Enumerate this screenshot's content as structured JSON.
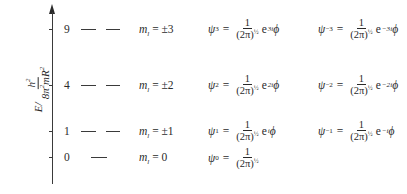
{
  "diagram": {
    "type": "energy-level-diagram",
    "y_axis": {
      "label_prefix": "E/",
      "label_numerator": "h",
      "label_numerator_sup": "2",
      "label_denominator": "8π",
      "label_denominator_sup1": "2",
      "label_denominator_mid": "mR",
      "label_denominator_sup2": "2"
    },
    "levels": [
      {
        "energy": "9",
        "degeneracy": 2,
        "ml_symbol": "m",
        "ml_sub": "l",
        "ml_value": "= ±3",
        "psi_pos": {
          "sym": "ψ",
          "sub": "3",
          "num": "1",
          "den": "(2π)",
          "den_sup": "½",
          "exp_base": "e",
          "exp_sup": "3i",
          "var": "ϕ"
        },
        "psi_neg": {
          "sym": "ψ",
          "sub": "−3",
          "num": "1",
          "den": "(2π)",
          "den_sup": "½",
          "exp_base": "e",
          "exp_sup": "−3i",
          "var": "ϕ"
        }
      },
      {
        "energy": "4",
        "degeneracy": 2,
        "ml_symbol": "m",
        "ml_sub": "l",
        "ml_value": "= ±2",
        "psi_pos": {
          "sym": "ψ",
          "sub": "2",
          "num": "1",
          "den": "(2π)",
          "den_sup": "½",
          "exp_base": "e",
          "exp_sup": "2i",
          "var": "ϕ"
        },
        "psi_neg": {
          "sym": "ψ",
          "sub": "−2",
          "num": "1",
          "den": "(2π)",
          "den_sup": "½",
          "exp_base": "e",
          "exp_sup": "−2i",
          "var": "ϕ"
        }
      },
      {
        "energy": "1",
        "degeneracy": 2,
        "ml_symbol": "m",
        "ml_sub": "l",
        "ml_value": "= ±1",
        "psi_pos": {
          "sym": "ψ",
          "sub": "1",
          "num": "1",
          "den": "(2π)",
          "den_sup": "½",
          "exp_base": "e",
          "exp_sup": "i",
          "var": "ϕ"
        },
        "psi_neg": {
          "sym": "ψ",
          "sub": "−1",
          "num": "1",
          "den": "(2π)",
          "den_sup": "½",
          "exp_base": "e",
          "exp_sup": "−i",
          "var": "ϕ"
        }
      },
      {
        "energy": "0",
        "degeneracy": 1,
        "ml_symbol": "m",
        "ml_sub": "l",
        "ml_value": "= 0",
        "psi_pos": {
          "sym": "ψ",
          "sub": "0",
          "num": "1",
          "den": "(2π)",
          "den_sup": "½",
          "exp_base": "",
          "exp_sup": "",
          "var": ""
        }
      }
    ],
    "line_color": "#3a3a3a",
    "text_color": "#2a2a2a"
  }
}
